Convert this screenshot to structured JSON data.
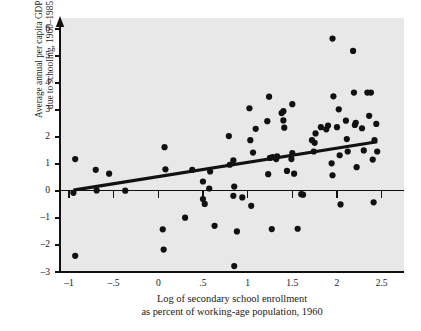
{
  "figure": {
    "background_color": "#ffffff",
    "panel_color": "#e8e8e8",
    "ink_color": "#111111"
  },
  "chart_data": {
    "type": "scatter",
    "title": "",
    "xlabel_line1": "Log of secondary school enrollment",
    "xlabel_line2": "as percent of working-age population, 1960",
    "ylabel_line1": "Average annual per capita GDP growth rate",
    "ylabel_line2": "due to schooling, 1960–1985 (percent)",
    "xlim": [
      -1.1,
      2.75
    ],
    "ylim": [
      -3.0,
      6.4
    ],
    "xticks": [
      -1,
      -0.5,
      0,
      0.5,
      1,
      1.5,
      2,
      2.5
    ],
    "xticklabels": [
      "–1",
      "–.5",
      "0",
      ".5",
      "1",
      "1.5",
      "2",
      "2.5"
    ],
    "yticks": [
      -3,
      -2,
      -1,
      0,
      1,
      2,
      3,
      4,
      5,
      6
    ],
    "yticklabels": [
      "–3",
      "–2",
      "–1",
      "0",
      "1",
      "2",
      "3",
      "4",
      "5",
      "6"
    ],
    "grid": false,
    "legend": null,
    "marker": {
      "shape": "circle",
      "color": "#111111",
      "size_px": 3.1
    },
    "trend_line": {
      "type": "linear-fit",
      "color": "#111111",
      "width_px": 3.2,
      "x_start": -0.95,
      "y_start": 0.03,
      "x_end": 2.45,
      "y_end": 1.82
    },
    "zero_line": {
      "y": 0,
      "color": "#111111",
      "width_px": 1
    },
    "points": [
      [
        -0.93,
        1.18
      ],
      [
        -0.95,
        -0.07
      ],
      [
        -0.93,
        -2.4
      ],
      [
        -0.7,
        0.78
      ],
      [
        -0.69,
        0.02
      ],
      [
        -0.55,
        0.64
      ],
      [
        -0.37,
        0.01
      ],
      [
        0.07,
        1.62
      ],
      [
        0.08,
        0.8
      ],
      [
        0.05,
        -1.42
      ],
      [
        0.06,
        -2.17
      ],
      [
        0.3,
        -0.99
      ],
      [
        0.38,
        0.78
      ],
      [
        0.5,
        0.35
      ],
      [
        0.5,
        -0.3
      ],
      [
        0.52,
        -0.48
      ],
      [
        0.58,
        0.72
      ],
      [
        0.57,
        0.09
      ],
      [
        0.63,
        -1.29
      ],
      [
        0.79,
        2.03
      ],
      [
        0.8,
        0.97
      ],
      [
        0.84,
        1.13
      ],
      [
        0.85,
        0.16
      ],
      [
        0.84,
        -0.18
      ],
      [
        0.85,
        -2.78
      ],
      [
        0.88,
        -1.5
      ],
      [
        0.94,
        -0.24
      ],
      [
        1.02,
        3.06
      ],
      [
        1.03,
        1.88
      ],
      [
        1.04,
        -0.55
      ],
      [
        1.06,
        1.42
      ],
      [
        1.09,
        2.3
      ],
      [
        1.22,
        2.58
      ],
      [
        1.24,
        3.49
      ],
      [
        1.23,
        0.62
      ],
      [
        1.25,
        1.22
      ],
      [
        1.28,
        1.25
      ],
      [
        1.27,
        -1.41
      ],
      [
        1.33,
        1.28
      ],
      [
        1.32,
        1.18
      ],
      [
        1.38,
        2.88
      ],
      [
        1.4,
        2.95
      ],
      [
        1.41,
        2.34
      ],
      [
        1.4,
        2.61
      ],
      [
        1.44,
        0.74
      ],
      [
        1.5,
        3.21
      ],
      [
        1.5,
        1.4
      ],
      [
        1.49,
        1.18
      ],
      [
        1.52,
        0.64
      ],
      [
        1.56,
        -1.4
      ],
      [
        1.6,
        -0.12
      ],
      [
        1.62,
        -0.14
      ],
      [
        1.72,
        1.88
      ],
      [
        1.74,
        1.46
      ],
      [
        1.76,
        2.13
      ],
      [
        1.75,
        1.78
      ],
      [
        1.82,
        2.36
      ],
      [
        1.88,
        2.28
      ],
      [
        1.9,
        2.42
      ],
      [
        1.95,
        5.64
      ],
      [
        1.96,
        3.5
      ],
      [
        1.94,
        1.02
      ],
      [
        1.95,
        0.58
      ],
      [
        2.0,
        2.36
      ],
      [
        2.02,
        3.02
      ],
      [
        2.03,
        1.32
      ],
      [
        2.04,
        -0.5
      ],
      [
        2.1,
        2.6
      ],
      [
        2.12,
        1.46
      ],
      [
        2.11,
        1.92
      ],
      [
        2.18,
        5.18
      ],
      [
        2.19,
        3.64
      ],
      [
        2.2,
        2.44
      ],
      [
        2.21,
        2.52
      ],
      [
        2.22,
        0.88
      ],
      [
        2.28,
        2.32
      ],
      [
        2.3,
        1.5
      ],
      [
        2.34,
        3.64
      ],
      [
        2.36,
        2.78
      ],
      [
        2.38,
        3.64
      ],
      [
        2.4,
        1.16
      ],
      [
        2.42,
        1.88
      ],
      [
        2.44,
        2.48
      ],
      [
        2.45,
        1.46
      ],
      [
        2.41,
        -0.42
      ]
    ]
  }
}
